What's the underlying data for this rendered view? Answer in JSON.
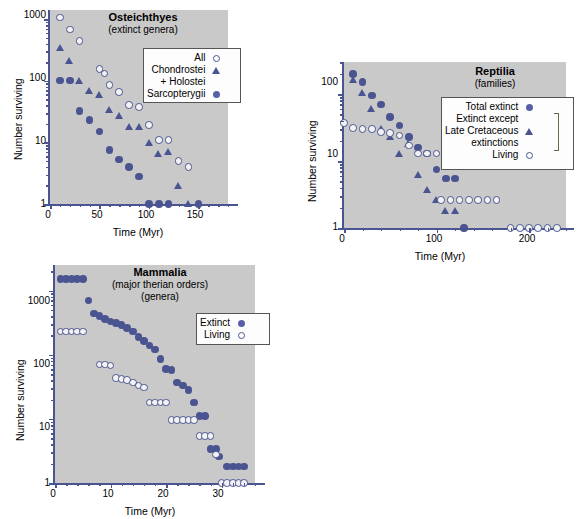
{
  "figure": {
    "background": "#ffffff",
    "plot_background": "#c9c9c9",
    "marker_color": "#4a5490",
    "axis_color": "#4a5490"
  },
  "chart_data": [
    {
      "type": "scatter",
      "id": "osteichthyes",
      "title": "Osteichthyes",
      "subtitle": "(extinct genera)",
      "xlabel": "Time (Myr)",
      "ylabel": "Number surviving",
      "xlim": [
        0,
        180
      ],
      "ylim": [
        1,
        1400
      ],
      "yscale": "log",
      "grid": false,
      "xticks": [
        0,
        50,
        100,
        150
      ],
      "xticklabels": [
        "0",
        "50",
        "100",
        "150"
      ],
      "yticks": [
        1,
        10,
        100,
        1000
      ],
      "yticklabels": [
        "1",
        "10",
        "100",
        "1000"
      ],
      "legend_position": "upper-right-inside",
      "series": [
        {
          "name": "All",
          "marker": "open-circle",
          "points": [
            [
              10,
              1050
            ],
            [
              20,
              680
            ],
            [
              30,
              440
            ],
            [
              50,
              155
            ],
            [
              55,
              130
            ],
            [
              60,
              85
            ],
            [
              70,
              65
            ],
            [
              80,
              40
            ],
            [
              90,
              37
            ],
            [
              100,
              19
            ],
            [
              110,
              11
            ],
            [
              120,
              11
            ],
            [
              130,
              5
            ],
            [
              140,
              4
            ]
          ]
        },
        {
          "name": "Chondrostei + Holostei",
          "marker": "triangle",
          "points": [
            [
              10,
              340
            ],
            [
              20,
              210
            ],
            [
              30,
              100
            ],
            [
              40,
              68
            ],
            [
              50,
              60
            ],
            [
              60,
              34
            ],
            [
              70,
              27
            ],
            [
              80,
              18
            ],
            [
              90,
              18
            ],
            [
              100,
              10
            ],
            [
              110,
              6.5
            ],
            [
              120,
              7
            ],
            [
              130,
              2
            ],
            [
              140,
              1
            ]
          ]
        },
        {
          "name": "Sarcopterygii",
          "marker": "filled-circle",
          "points": [
            [
              10,
              100
            ],
            [
              20,
              100
            ],
            [
              30,
              32
            ],
            [
              40,
              23
            ],
            [
              50,
              15
            ],
            [
              60,
              7.5
            ],
            [
              70,
              5.3
            ],
            [
              80,
              4
            ],
            [
              90,
              2.8
            ],
            [
              100,
              1
            ],
            [
              110,
              1
            ],
            [
              120,
              1
            ],
            [
              150,
              1
            ]
          ]
        }
      ]
    },
    {
      "type": "scatter",
      "id": "reptilia",
      "title": "Reptilia",
      "subtitle": "(families)",
      "xlabel": "Time (Myr)",
      "ylabel": "Number surviving",
      "xlim": [
        0,
        240
      ],
      "ylim": [
        1,
        300
      ],
      "yscale": "log",
      "grid": false,
      "xticks": [
        0,
        100,
        200
      ],
      "xticklabels": [
        "0",
        "100",
        "200"
      ],
      "yticks": [
        1,
        10,
        100
      ],
      "yticklabels": [
        "1",
        "10",
        "100"
      ],
      "legend_position": "middle-right-inside",
      "series": [
        {
          "name": "Total extinct",
          "marker": "filled-circle",
          "points": [
            [
              10,
              200
            ],
            [
              20,
              150
            ],
            [
              30,
              95
            ],
            [
              40,
              70
            ],
            [
              50,
              45
            ],
            [
              60,
              34
            ],
            [
              70,
              23
            ],
            [
              80,
              16
            ],
            [
              90,
              13
            ],
            [
              100,
              7.5
            ],
            [
              110,
              5.5
            ],
            [
              120,
              5.5
            ],
            [
              130,
              1
            ]
          ]
        },
        {
          "name": "Extinct except Late Cretaceous extinctions",
          "marker": "triangle",
          "points": [
            [
              10,
              160
            ],
            [
              20,
              105
            ],
            [
              30,
              60
            ],
            [
              40,
              30
            ],
            [
              50,
              23
            ],
            [
              60,
              13
            ],
            [
              70,
              18
            ],
            [
              80,
              6.2
            ],
            [
              90,
              3.7
            ],
            [
              100,
              2.6
            ],
            [
              110,
              1.8
            ],
            [
              120,
              1.8
            ]
          ]
        },
        {
          "name": "Living",
          "marker": "open-circle",
          "points": [
            [
              0,
              37
            ],
            [
              10,
              31
            ],
            [
              20,
              30
            ],
            [
              30,
              30
            ],
            [
              40,
              27
            ],
            [
              50,
              26
            ],
            [
              60,
              24
            ],
            [
              70,
              17
            ],
            [
              80,
              13
            ],
            [
              90,
              13
            ],
            [
              100,
              13
            ],
            [
              105,
              2.6
            ],
            [
              115,
              2.6
            ],
            [
              125,
              2.6
            ],
            [
              135,
              2.6
            ],
            [
              145,
              2.6
            ],
            [
              155,
              2.6
            ],
            [
              165,
              2.6
            ],
            [
              180,
              1
            ],
            [
              190,
              1
            ],
            [
              200,
              1
            ],
            [
              210,
              1
            ],
            [
              220,
              1
            ],
            [
              230,
              1
            ]
          ]
        }
      ]
    },
    {
      "type": "scatter",
      "id": "mammalia",
      "title": "Mammalia",
      "subtitle": "(major therian orders)",
      "subtitle2": "(genera)",
      "xlabel": "Time (Myr)",
      "ylabel": "Number surviving",
      "xlim": [
        0,
        36
      ],
      "ylim": [
        1,
        2500
      ],
      "yscale": "log",
      "grid": false,
      "xticks": [
        0,
        10,
        20,
        30
      ],
      "xticklabels": [
        "0",
        "10",
        "20",
        "30"
      ],
      "yticks": [
        1,
        10,
        100,
        1000
      ],
      "yticklabels": [
        "1",
        "10",
        "100",
        "1000"
      ],
      "legend_position": "upper-right-inside",
      "series": [
        {
          "name": "Extinct",
          "marker": "filled-circle",
          "points": [
            [
              1,
              1500
            ],
            [
              2,
              1500
            ],
            [
              3,
              1500
            ],
            [
              4,
              1500
            ],
            [
              5,
              1500
            ],
            [
              6,
              700
            ],
            [
              7,
              440
            ],
            [
              8,
              400
            ],
            [
              9,
              360
            ],
            [
              10,
              330
            ],
            [
              11,
              310
            ],
            [
              12,
              290
            ],
            [
              13,
              260
            ],
            [
              14,
              230
            ],
            [
              15,
              190
            ],
            [
              16,
              165
            ],
            [
              17,
              140
            ],
            [
              18,
              120
            ],
            [
              19,
              85
            ],
            [
              20,
              60
            ],
            [
              21,
              58
            ],
            [
              22,
              37
            ],
            [
              23,
              33
            ],
            [
              24,
              28
            ],
            [
              25,
              18
            ],
            [
              26,
              11
            ],
            [
              27,
              11
            ],
            [
              28,
              3.4
            ],
            [
              29,
              3.4
            ],
            [
              29.5,
              2.6
            ],
            [
              31,
              1.8
            ],
            [
              32,
              1.8
            ],
            [
              33,
              1.8
            ],
            [
              34,
              1.8
            ]
          ]
        },
        {
          "name": "Living",
          "marker": "open-circle",
          "points": [
            [
              1,
              230
            ],
            [
              2,
              230
            ],
            [
              3,
              230
            ],
            [
              4,
              230
            ],
            [
              5,
              230
            ],
            [
              8,
              70
            ],
            [
              9,
              70
            ],
            [
              10,
              68
            ],
            [
              11,
              43
            ],
            [
              12,
              42
            ],
            [
              13,
              40
            ],
            [
              14,
              37
            ],
            [
              15,
              33
            ],
            [
              16,
              31
            ],
            [
              17,
              18
            ],
            [
              18,
              18
            ],
            [
              19,
              18
            ],
            [
              20,
              18
            ],
            [
              21,
              9.5
            ],
            [
              22,
              9.5
            ],
            [
              23,
              9.5
            ],
            [
              24,
              9.5
            ],
            [
              25,
              9.5
            ],
            [
              26,
              5.4
            ],
            [
              27,
              5.4
            ],
            [
              28,
              5.4
            ],
            [
              29,
              2.8
            ],
            [
              30,
              1
            ],
            [
              31,
              1
            ],
            [
              32,
              1
            ],
            [
              33,
              1
            ],
            [
              34,
              1
            ]
          ]
        }
      ]
    }
  ],
  "legends": {
    "osteichthyes": [
      {
        "label": "All",
        "marker": "open-circle"
      },
      {
        "label": "Chondrostei",
        "marker": "triangle"
      },
      {
        "label": "+ Holostei",
        "marker": "none"
      },
      {
        "label": "Sarcopterygii",
        "marker": "filled-circle"
      }
    ],
    "reptilia": [
      {
        "label": "Total extinct",
        "marker": "filled-circle"
      },
      {
        "label": "Extinct except",
        "marker": "none"
      },
      {
        "label": "Late Cretaceous",
        "marker": "triangle"
      },
      {
        "label": "extinctions",
        "marker": "none"
      },
      {
        "label": "Living",
        "marker": "open-circle"
      }
    ],
    "mammalia": [
      {
        "label": "Extinct",
        "marker": "filled-circle"
      },
      {
        "label": "Living",
        "marker": "open-circle"
      }
    ]
  }
}
